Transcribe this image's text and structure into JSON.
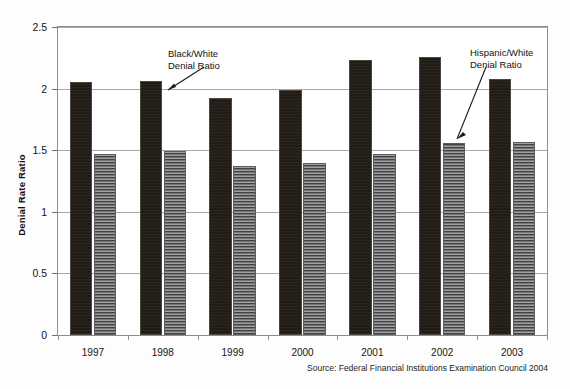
{
  "chart_data": {
    "type": "bar",
    "title": "",
    "xlabel": "",
    "ylabel": "Denial Rate Ratio",
    "ylim": [
      0,
      2.5
    ],
    "ytick_values": [
      0,
      0.5,
      1,
      1.5,
      2,
      2.5
    ],
    "ytick_labels": [
      "0",
      "0.5",
      "1",
      "1.5",
      "2",
      "2.5"
    ],
    "grid": true,
    "legend_position": "none",
    "categories": [
      "1997",
      "1998",
      "1999",
      "2000",
      "2001",
      "2002",
      "2003"
    ],
    "series": [
      {
        "name": "Black/White Denial Ratio",
        "color": "#211c16",
        "values": [
          2.05,
          2.06,
          1.92,
          1.99,
          2.23,
          2.26,
          2.08
        ]
      },
      {
        "name": "Hispanic/White Denial Ratio",
        "color": "#767676",
        "values": [
          1.47,
          1.49,
          1.37,
          1.4,
          1.47,
          1.56,
          1.57
        ]
      }
    ],
    "annotations": [
      {
        "id": "black-white",
        "text_line1": "Black/White",
        "text_line2": "Denial Ratio",
        "points_to": "1998 black bar"
      },
      {
        "id": "hispanic-white",
        "text_line1": "Hispanic/White",
        "text_line2": "Denial Ratio",
        "points_to": "2002 grey bar"
      }
    ],
    "source_note": "Source: Federal Financial Institutions Examination Council 2004"
  }
}
